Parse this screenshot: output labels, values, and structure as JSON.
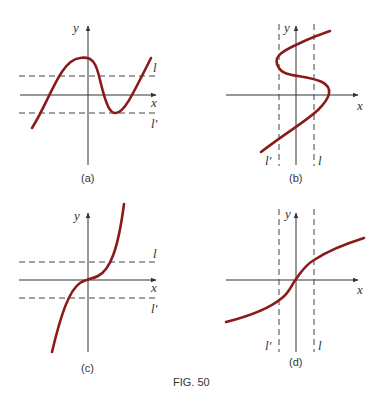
{
  "figure": {
    "caption": "FIG. 50",
    "colors": {
      "curve": "#8b1a1a",
      "axis": "#333333",
      "background": "#ffffff"
    },
    "panels": [
      {
        "id": "a",
        "label": "(a)",
        "x_label": "x",
        "y_label": "y",
        "line_labels": [
          "l",
          "l'"
        ],
        "line_orientation": "horizontal",
        "description": "cubic-like curve with local max above line l and local min touching line l'"
      },
      {
        "id": "b",
        "label": "(b)",
        "x_label": "x",
        "y_label": "y",
        "line_labels": [
          "l'",
          "l"
        ],
        "line_orientation": "vertical",
        "description": "S-shaped curve turning back on itself between vertical lines l' and l"
      },
      {
        "id": "c",
        "label": "(c)",
        "x_label": "x",
        "y_label": "y",
        "line_labels": [
          "l",
          "l'"
        ],
        "line_orientation": "horizontal",
        "description": "monotonically increasing cubic through origin crossing horizontal lines l and l'"
      },
      {
        "id": "d",
        "label": "(d)",
        "x_label": "x",
        "y_label": "y",
        "line_labels": [
          "l'",
          "l"
        ],
        "line_orientation": "vertical",
        "description": "monotonically increasing cube-root-like curve through origin crossing vertical lines l' and l"
      }
    ]
  }
}
